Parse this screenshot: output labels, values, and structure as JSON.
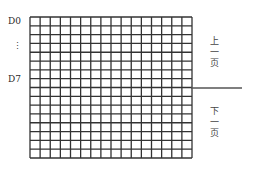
{
  "diagram": {
    "grid": {
      "columns": 16,
      "rows": 16,
      "left": 29,
      "top": 16,
      "width": 162,
      "height": 141,
      "line_color": "#333333"
    },
    "left_labels": {
      "top": "D0",
      "ellipsis": "⋮",
      "bottom": "D7"
    },
    "divider": {
      "y": 88,
      "x_end": 242,
      "color": "#555555"
    },
    "right_labels": {
      "upper": {
        "chars": [
          "上",
          "一",
          "页"
        ],
        "text": "上一页"
      },
      "lower": {
        "chars": [
          "下",
          "一",
          "页"
        ],
        "text": "下一页"
      }
    }
  }
}
